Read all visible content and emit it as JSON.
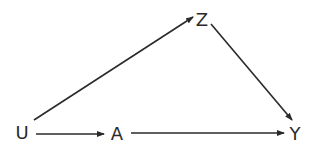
{
  "diagram": {
    "type": "directed-acyclic-graph",
    "nodes": [
      {
        "id": "U",
        "label": "U",
        "x": 22,
        "y": 133
      },
      {
        "id": "A",
        "label": "A",
        "x": 117,
        "y": 134
      },
      {
        "id": "Z",
        "label": "Z",
        "x": 202,
        "y": 20
      },
      {
        "id": "Y",
        "label": "Y",
        "x": 295,
        "y": 134
      }
    ],
    "edges": [
      {
        "from": "U",
        "to": "Z",
        "x1": 34,
        "y1": 120,
        "x2": 193,
        "y2": 17
      },
      {
        "from": "Z",
        "to": "Y",
        "x1": 211,
        "y1": 24,
        "x2": 292,
        "y2": 120
      },
      {
        "from": "U",
        "to": "A",
        "x1": 36,
        "y1": 134,
        "x2": 104,
        "y2": 134
      },
      {
        "from": "A",
        "to": "Y",
        "x1": 131,
        "y1": 133,
        "x2": 284,
        "y2": 133
      }
    ],
    "colors": {
      "stroke": "#2a2a2a",
      "text": "#2a2a2a",
      "background": "#ffffff"
    }
  }
}
